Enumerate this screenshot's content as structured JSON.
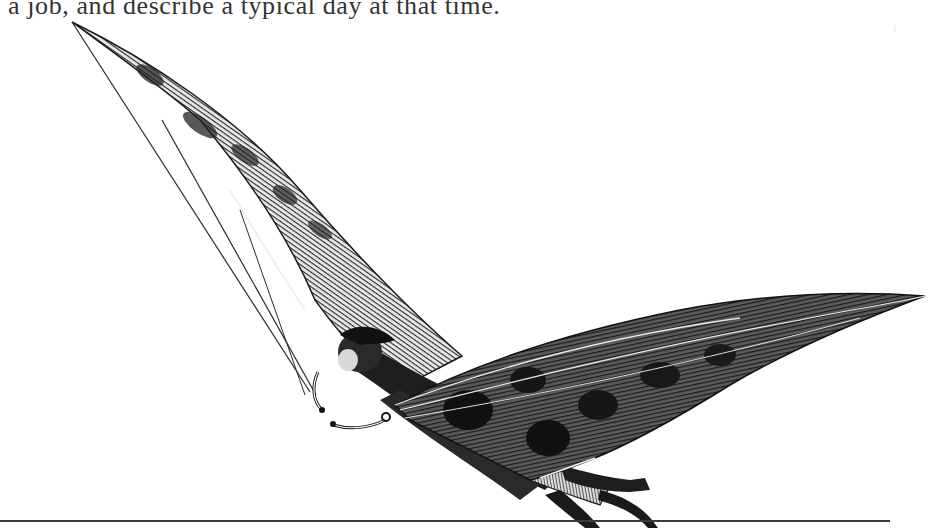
{
  "page": {
    "text_line": "a job, and describe a typical day at that time."
  },
  "illustration": {
    "subject": "engraving of a man flying with bat-like wings",
    "colors": {
      "ink": "#1e1e1e",
      "wing_hatch": "#4a4a4a",
      "paper": "#ffffff"
    }
  }
}
